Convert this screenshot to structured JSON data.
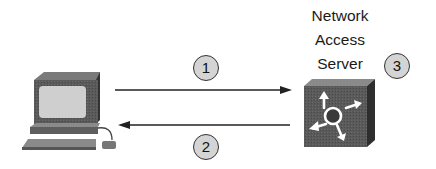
{
  "diagram": {
    "nodes": [
      {
        "id": "client",
        "label": "",
        "icon": "workstation-icon"
      },
      {
        "id": "nas",
        "label_lines": [
          "Network",
          "Access",
          "Server"
        ],
        "icon": "network-access-server-icon"
      }
    ],
    "steps": [
      {
        "number": "1",
        "direction": "client-to-nas"
      },
      {
        "number": "2",
        "direction": "nas-to-client"
      },
      {
        "number": "3",
        "at": "nas"
      }
    ],
    "colors": {
      "badge_fill": "#d4d4d4",
      "line": "#222222",
      "device_dark": "#4a4a4a",
      "screen": "#cfcfcf"
    }
  }
}
